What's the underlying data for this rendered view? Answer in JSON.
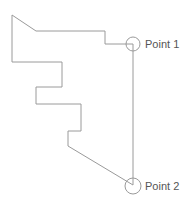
{
  "diagram": {
    "stroke_color": "#9a9a9a",
    "label_color": "#555555",
    "points": [
      {
        "label": "Point 1"
      },
      {
        "label": "Point 2"
      }
    ]
  }
}
